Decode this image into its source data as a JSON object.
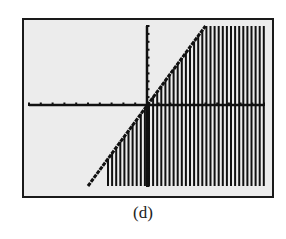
{
  "figure": {
    "caption": "(d)",
    "frame_color": "#1a1a1a",
    "screen_background": "#ececec",
    "ink_color": "#111111"
  },
  "chart_data": {
    "type": "area",
    "boundary_line": {
      "slope": 2,
      "intercept": 0,
      "label": ""
    },
    "shaded_side": "right-of-line (y <= 2x)",
    "title": "",
    "xlabel": "",
    "ylabel": "",
    "x_ticks_left_of_origin": 10,
    "x_ticks_right_of_origin": 10,
    "y_ticks_above_origin": 10,
    "y_ticks_below_origin": 10,
    "xlim": [
      -10,
      10
    ],
    "ylim": [
      -10,
      10
    ],
    "grid": false,
    "legend": null
  }
}
